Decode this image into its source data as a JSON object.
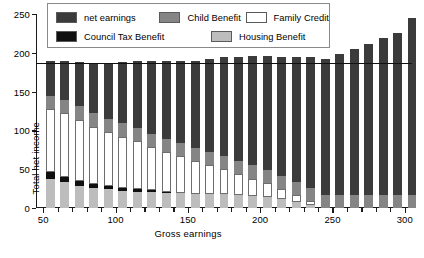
{
  "chart_data": {
    "type": "bar",
    "stacked": true,
    "title": "",
    "xlabel": "Gross earnings",
    "ylabel": "Total net income",
    "xlim": [
      45,
      305
    ],
    "ylim": [
      0,
      250
    ],
    "ytick_values": [
      0,
      50,
      100,
      150,
      200,
      250
    ],
    "ytick_labels": [
      "0",
      "50",
      "100",
      "150",
      "200",
      "250"
    ],
    "xtick_values": [
      50,
      60,
      70,
      80,
      90,
      100,
      110,
      120,
      130,
      140,
      150,
      160,
      170,
      180,
      190,
      200,
      210,
      220,
      230,
      240,
      250,
      260,
      270,
      280,
      290,
      300
    ],
    "xtick_labeled": [
      50,
      100,
      150,
      200,
      250,
      300
    ],
    "xtick_labels": [
      "50",
      "100",
      "150",
      "200",
      "250",
      "300"
    ],
    "grid": false,
    "legend_position": "top",
    "categories": [
      50,
      60,
      70,
      80,
      90,
      100,
      110,
      120,
      130,
      140,
      150,
      160,
      170,
      180,
      190,
      200,
      210,
      220,
      230,
      240,
      250,
      260,
      270,
      280,
      290,
      300
    ],
    "stack_order_bottom_to_top": [
      "Housing Benefit",
      "Council Tax Benefit",
      "Family Credit",
      "Child Benefit",
      "net earnings"
    ],
    "series": [
      {
        "name": "Housing Benefit",
        "color": "#bdbdbd",
        "values": [
          37,
          33,
          29,
          26,
          24,
          22,
          21,
          20,
          19,
          19,
          18,
          18,
          18,
          17,
          16,
          14,
          11,
          8,
          4,
          0,
          0,
          0,
          0,
          0,
          0,
          0
        ]
      },
      {
        "name": "Council Tax Benefit",
        "color": "#101010",
        "values": [
          9,
          7,
          6,
          5,
          4,
          4,
          4,
          3,
          2,
          1,
          0,
          0,
          0,
          0,
          0,
          0,
          0,
          0,
          0,
          0,
          0,
          0,
          0,
          0,
          0,
          0
        ]
      },
      {
        "name": "Family Credit",
        "color": "#ffffff",
        "values": [
          82,
          82,
          79,
          74,
          70,
          66,
          61,
          56,
          51,
          47,
          42,
          37,
          32,
          27,
          22,
          18,
          13,
          9,
          5,
          0,
          0,
          0,
          0,
          0,
          0,
          0
        ]
      },
      {
        "name": "Child Benefit",
        "color": "#858585",
        "values": [
          17,
          17,
          17,
          17,
          17,
          17,
          17,
          17,
          17,
          17,
          17,
          17,
          17,
          17,
          17,
          17,
          17,
          17,
          17,
          17,
          17,
          17,
          17,
          17,
          17,
          17
        ]
      },
      {
        "name": "net earnings",
        "color": "#3b3b3b",
        "values": [
          44,
          50,
          57,
          65,
          72,
          79,
          86,
          93,
          100,
          106,
          113,
          120,
          127,
          134,
          141,
          147,
          154,
          161,
          168,
          175,
          181,
          188,
          195,
          202,
          209,
          228
        ]
      }
    ],
    "totals": [
      189,
      189,
      188,
      187,
      187,
      188,
      189,
      189,
      189,
      190,
      190,
      192,
      194,
      195,
      196,
      196,
      195,
      195,
      194,
      192,
      198,
      205,
      212,
      219,
      226,
      245
    ],
    "reference_line": {
      "orientation": "horizontal",
      "value": 187,
      "color": "#111111"
    },
    "legend": [
      {
        "label": "net earnings",
        "color": "#3b3b3b"
      },
      {
        "label": "Child Benefit",
        "color": "#858585"
      },
      {
        "label": "Family Credit",
        "color": "#ffffff"
      },
      {
        "label": "Council Tax Benefit",
        "color": "#101010"
      },
      {
        "label": "Housing Benefit",
        "color": "#bdbdbd"
      }
    ]
  }
}
